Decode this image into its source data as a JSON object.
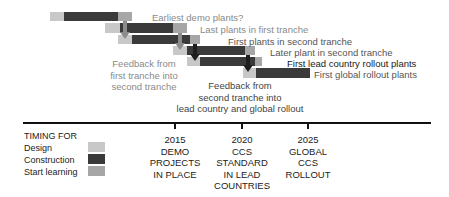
{
  "diagram": {
    "rows": [
      {
        "label": "Earliest demo plants?",
        "label_style": "grey",
        "design": [
          50,
          64
        ],
        "construction": [
          64,
          118
        ],
        "learning": [
          118,
          132
        ],
        "top": 12
      },
      {
        "label": "Last plants in first tranche",
        "label_style": "grey",
        "design": [
          105,
          120
        ],
        "construction": [
          120,
          173
        ],
        "learning": [
          173,
          187
        ],
        "top": 23
      },
      {
        "label": "First plants in second tranche",
        "label_style": "mid",
        "design": [
          118,
          132
        ],
        "construction": [
          132,
          190
        ],
        "learning": [
          190,
          200
        ],
        "top": 35
      },
      {
        "label": "Later plant in second tranche",
        "label_style": "mid",
        "design": [
          173,
          187
        ],
        "construction": [
          187,
          245
        ],
        "learning": [
          245,
          255
        ],
        "top": 46
      },
      {
        "label": "First lead country rollout plants",
        "label_style": "dark",
        "design": [
          187,
          200
        ],
        "construction": [
          200,
          255
        ],
        "learning": [
          255,
          262
        ],
        "top": 57
      },
      {
        "label": "First global rollout plants",
        "label_style": "mid",
        "design": [
          243,
          256
        ],
        "construction": [
          256,
          310
        ],
        "learning": null,
        "top": 68
      }
    ],
    "notes": [
      {
        "id": "feedback-first",
        "lines": [
          "Feedback from",
          "first tranche into",
          "second tranche"
        ],
        "color": "#8a8a8a"
      },
      {
        "id": "feedback-second",
        "lines": [
          "Feedback from",
          "second tranche into",
          "lead country and global rollout"
        ],
        "color": "#444444"
      }
    ],
    "timeline": {
      "milestones": [
        {
          "year": "2015",
          "lines": [
            "DEMO",
            "PROJECTS",
            "IN PLACE"
          ]
        },
        {
          "year": "2020",
          "lines": [
            "CCS",
            "STANDARD",
            "IN LEAD",
            "COUNTRIES"
          ]
        },
        {
          "year": "2025",
          "lines": [
            "GLOBAL",
            "CCS",
            "ROLLOUT"
          ]
        }
      ]
    },
    "legend": {
      "title": "TIMING FOR",
      "items": [
        {
          "label": "Design",
          "color": "#c8c8c8"
        },
        {
          "label": "Construction",
          "color": "#3a3a3a"
        },
        {
          "label": "Start learning",
          "color": "#a6a6a6"
        }
      ]
    }
  }
}
